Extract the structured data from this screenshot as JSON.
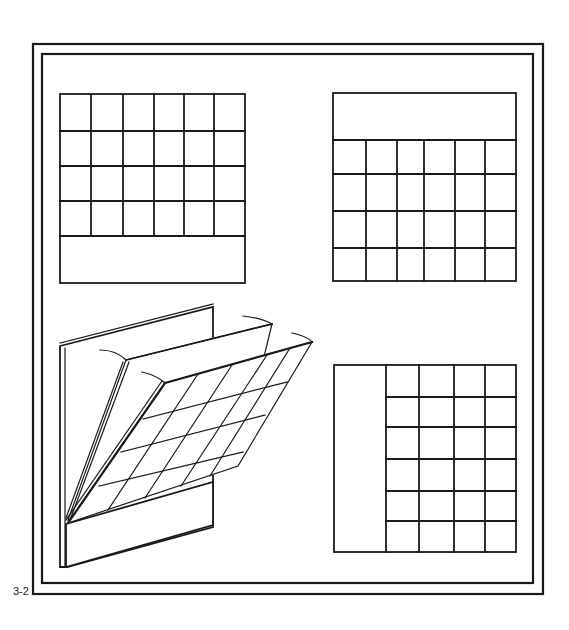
{
  "figure": {
    "label": "3-2",
    "colors": {
      "line": "#1a1a1a",
      "background": "#ffffff"
    },
    "frame": {
      "outer": {
        "x": 33,
        "y": 44,
        "w": 510,
        "h": 550
      },
      "inner": {
        "x": 42,
        "y": 54,
        "w": 491,
        "h": 529
      }
    },
    "panels": [
      {
        "id": "top-left",
        "description": "Grid with blank strip at bottom",
        "layout": "grid-above-strip",
        "columns": 6,
        "rows": 4,
        "strip_position": "bottom"
      },
      {
        "id": "top-right",
        "description": "Grid with blank strip at top",
        "layout": "strip-above-grid",
        "columns": 6,
        "rows": 4,
        "strip_position": "top"
      },
      {
        "id": "bottom-left",
        "description": "Perspective view of hinged flip panels with grid over base board",
        "layout": "3d-flip-panels",
        "flip_sheets": 2,
        "grid_columns": 4,
        "grid_rows": 4
      },
      {
        "id": "bottom-right",
        "description": "Grid with blank strip at left",
        "layout": "strip-left-of-grid",
        "columns": 4,
        "rows": 6,
        "strip_position": "left"
      }
    ]
  }
}
